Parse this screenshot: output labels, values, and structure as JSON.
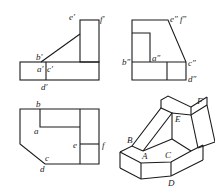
{
  "figure": {
    "colors": {
      "line": "#1a1a1a",
      "text": "#222222",
      "background": "#ffffff"
    },
    "front_view": {
      "labels": {
        "e": "e′",
        "f": "f′",
        "b": "b′",
        "a": "a′",
        "c": "c′",
        "d": "d′"
      }
    },
    "side_view": {
      "labels": {
        "ef": "e″ f″",
        "b": "b″",
        "a": "a″",
        "c": "c″",
        "d": "d″"
      }
    },
    "top_view": {
      "labels": {
        "b": "b",
        "a": "a",
        "e": "e",
        "f": "f",
        "c": "c",
        "d": "d"
      }
    },
    "isometric_view": {
      "labels": {
        "B": "B",
        "A": "A",
        "C": "C",
        "D": "D",
        "E": "E",
        "F": "F"
      }
    }
  }
}
